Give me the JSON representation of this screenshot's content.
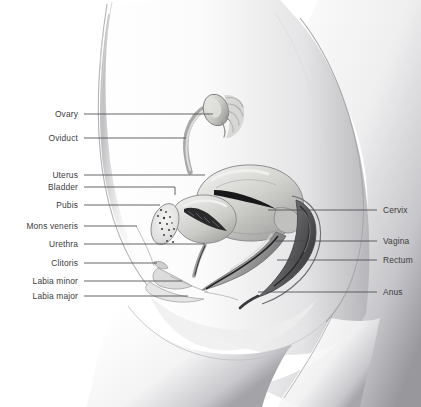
{
  "figure": {
    "background_color": "#ffffff",
    "label_color": "#3c3c40",
    "leader_line_color": "#4a4a4e",
    "skin_tone_light": "#fdfdfd",
    "skin_tone_shadow": "#9a9a9e",
    "organ_tone": "#b9b9bd",
    "organ_dark": "#2e2e32"
  },
  "labels_left": [
    {
      "id": "ovary",
      "text": "Ovary",
      "text_x": 78,
      "y": 114,
      "line_to_x": 213,
      "elbow": null
    },
    {
      "id": "oviduct",
      "text": "Oviduct",
      "text_x": 78,
      "y": 138,
      "line_to_x": 186,
      "elbow": null
    },
    {
      "id": "uterus",
      "text": "Uterus",
      "text_x": 78,
      "y": 175,
      "line_to_x": 205,
      "elbow": null
    },
    {
      "id": "bladder",
      "text": "Bladder",
      "text_x": 78,
      "y": 187,
      "line_to_x": 175,
      "elbow": 195
    },
    {
      "id": "pubis",
      "text": "Pubis",
      "text_x": 78,
      "y": 205,
      "line_to_x": 158,
      "elbow": null
    },
    {
      "id": "mons-veneris",
      "text": "Mons veneris",
      "text_x": 78,
      "y": 226,
      "line_to_x": 137,
      "elbow": null
    },
    {
      "id": "urethra",
      "text": "Urethra",
      "text_x": 78,
      "y": 244,
      "line_to_x": 205,
      "elbow": null
    },
    {
      "id": "clitoris",
      "text": "Clitoris",
      "text_x": 78,
      "y": 263,
      "line_to_x": 157,
      "elbow": null
    },
    {
      "id": "labia-minor",
      "text": "Labia minor",
      "text_x": 78,
      "y": 281,
      "line_to_x": 182,
      "elbow": null
    },
    {
      "id": "labia-major",
      "text": "Labia major",
      "text_x": 78,
      "y": 296,
      "line_to_x": 188,
      "elbow": null
    }
  ],
  "labels_right": [
    {
      "id": "cervix",
      "text": "Cervix",
      "text_x": 383,
      "y": 210,
      "line_from_x": 268
    },
    {
      "id": "vagina",
      "text": "Vagina",
      "text_x": 383,
      "y": 241,
      "line_from_x": 275
    },
    {
      "id": "rectum",
      "text": "Rectum",
      "text_x": 383,
      "y": 260,
      "line_from_x": 277
    },
    {
      "id": "anus",
      "text": "Anus",
      "text_x": 383,
      "y": 292,
      "line_from_x": 258
    }
  ]
}
